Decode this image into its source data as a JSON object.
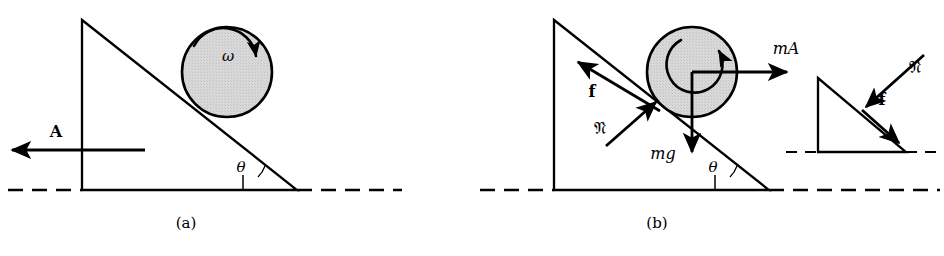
{
  "figure": {
    "background_color": "#ffffff",
    "stroke_color": "#000000",
    "ball_fill_color": "#d4d4d4",
    "width": 944,
    "height": 256
  },
  "panels": [
    {
      "id": "a",
      "caption": "(a)",
      "caption_x": 186,
      "caption_y": 228,
      "description": "Wedge with vertical left face, inclined hypotenuse, ball spinning with angular velocity omega, wedge accelerating left with acceleration A",
      "wedge": {
        "apex_x": 82,
        "apex_y": 20,
        "base_left_x": 82,
        "base_left_y": 190,
        "base_right_x": 297,
        "base_right_y": 190
      },
      "ball": {
        "center_x": 227,
        "center_y": 72,
        "radius": 45
      },
      "labels": [
        {
          "name": "omega-label",
          "text": "ω",
          "x": 228,
          "y": 61,
          "style": "italic-serif",
          "size": 15
        },
        {
          "name": "acceleration-label",
          "text": "A",
          "x": 56,
          "y": 137,
          "style": "bold",
          "size": 17
        },
        {
          "name": "incline-angle-label",
          "text": "θ",
          "x": 241,
          "y": 172,
          "style": "italic-serif",
          "size": 15
        }
      ],
      "vectors": [
        {
          "name": "acceleration-vector-A",
          "from_x": 145,
          "from_y": 150,
          "to_x": 10,
          "to_y": 150,
          "label": "A",
          "direction": "left"
        },
        {
          "name": "angular-velocity-arc-omega",
          "kind": "arc",
          "label": "ω",
          "direction": "clockwise"
        }
      ],
      "ground_line": {
        "y": 190,
        "dash_left_from": 8,
        "dash_left_to": 82,
        "dash_right_from": 297,
        "dash_right_to": 400
      }
    },
    {
      "id": "b",
      "caption": "(b)",
      "caption_x": 657,
      "caption_y": 228,
      "description": "Free-body diagram: friction f up the incline, normal force N perpendicular into ball, weight mg down, pseudo-force mA to the right; inset shows reaction forces on the wedge",
      "wedge": {
        "apex_x": 554,
        "apex_y": 20,
        "base_left_x": 554,
        "base_left_y": 190,
        "base_right_x": 769,
        "base_right_y": 190
      },
      "ball": {
        "center_x": 692,
        "center_y": 72,
        "radius": 45
      },
      "labels": [
        {
          "name": "friction-label-f",
          "text": "f",
          "x": 592,
          "y": 96,
          "style": "bold",
          "size": 16
        },
        {
          "name": "normal-force-label-N",
          "text": "𝔑",
          "x": 600,
          "y": 133,
          "style": "fraktur",
          "size": 17
        },
        {
          "name": "weight-label-mg",
          "text": "mg",
          "x": 663,
          "y": 159,
          "style": "italic-serif",
          "size": 16
        },
        {
          "name": "pseudo-force-label-mA",
          "text": "mA",
          "x": 786,
          "y": 54,
          "style": "italic-bold-mixed",
          "size": 17
        },
        {
          "name": "incline-angle-label",
          "text": "θ",
          "x": 713,
          "y": 172,
          "style": "italic-serif",
          "size": 15
        }
      ],
      "vectors": [
        {
          "name": "friction-vector-f",
          "from_x": 658,
          "from_y": 110,
          "to_x": 578,
          "to_y": 62,
          "label": "f",
          "direction": "up-incline"
        },
        {
          "name": "normal-force-vector-N",
          "from_x": 608,
          "from_y": 144,
          "to_x": 654,
          "to_y": 103,
          "label": "𝔑",
          "direction": "perpendicular-into-ball"
        },
        {
          "name": "weight-vector-mg",
          "from_x": 692,
          "from_y": 72,
          "to_x": 692,
          "to_y": 153,
          "label": "mg",
          "direction": "down"
        },
        {
          "name": "pseudo-force-vector-mA",
          "from_x": 692,
          "from_y": 72,
          "to_x": 789,
          "to_y": 72,
          "label": "mA",
          "direction": "right"
        },
        {
          "name": "angular-acceleration-arc",
          "kind": "arc",
          "label": "",
          "direction": "clockwise"
        }
      ],
      "ground_line": {
        "y": 190,
        "dash_left_from": 480,
        "dash_left_to": 554,
        "dash_right_from": 769,
        "dash_right_to": 944
      },
      "inset": {
        "name": "wedge-reaction-inset",
        "description": "Small wedge showing reaction normal force N pressing into the incline and reaction friction f acting down the incline",
        "wedge": {
          "apex_x": 818,
          "apex_y": 78,
          "base_left_x": 818,
          "base_left_y": 152,
          "base_right_x": 906,
          "base_right_y": 152
        },
        "labels": [
          {
            "name": "inset-normal-force-label-N",
            "text": "𝔑",
            "x": 912,
            "y": 72,
            "style": "fraktur",
            "size": 17
          },
          {
            "name": "inset-friction-label-f",
            "text": "f",
            "x": 880,
            "y": 104,
            "style": "bold",
            "size": 16
          }
        ],
        "vectors": [
          {
            "name": "inset-normal-force-vector-N",
            "from_x": 922,
            "from_y": 56,
            "to_x": 868,
            "to_y": 105,
            "direction": "down-left-into-surface"
          },
          {
            "name": "inset-friction-vector-f",
            "from_x": 862,
            "from_y": 110,
            "to_x": 898,
            "to_y": 142,
            "direction": "down-incline"
          }
        ],
        "ground_line": {
          "y": 152,
          "dash_left_from": 786,
          "dash_left_to": 818,
          "dash_right_from": 906,
          "dash_right_to": 936
        }
      }
    }
  ]
}
